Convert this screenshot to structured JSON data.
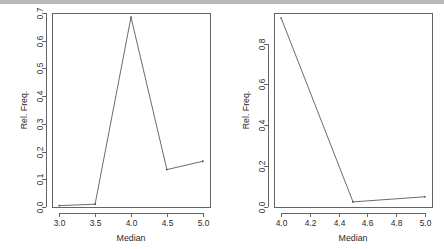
{
  "page": {
    "width": 444,
    "height": 249,
    "background": "#ffffff",
    "top_bar_color": "#b9b9b9",
    "line_color": "#5a5a5a",
    "axis_color": "#646464",
    "text_color": "#2b2b2b"
  },
  "chart_data": [
    {
      "id": "left",
      "type": "line",
      "title": "",
      "xlabel": "Median",
      "ylabel": "Rel. Freq.",
      "x": [
        3.0,
        3.5,
        4.0,
        4.5,
        5.0
      ],
      "values": [
        0.005,
        0.01,
        0.685,
        0.135,
        0.165
      ],
      "xlim": [
        2.9,
        5.1
      ],
      "ylim": [
        0.0,
        0.7
      ],
      "xticks": [
        3.0,
        3.5,
        4.0,
        4.5,
        5.0
      ],
      "xticklabels": [
        "3.0",
        "3.5",
        "4.0",
        "4.5",
        "5.0"
      ],
      "yticks": [
        0.0,
        0.1,
        0.2,
        0.3,
        0.4,
        0.5,
        0.6,
        0.7
      ],
      "yticklabels": [
        "0.0",
        "0.1",
        "0.2",
        "0.3",
        "0.4",
        "0.5",
        "0.6",
        "0.7"
      ],
      "grid": false,
      "legend": false,
      "markers": true
    },
    {
      "id": "right",
      "type": "line",
      "title": "",
      "xlabel": "Median",
      "ylabel": "Rel. Freq.",
      "x": [
        4.0,
        4.5,
        5.0
      ],
      "values": [
        0.925,
        0.025,
        0.05
      ],
      "xlim": [
        3.95,
        5.05
      ],
      "ylim": [
        0.0,
        0.95
      ],
      "xticks": [
        4.0,
        4.2,
        4.4,
        4.6,
        4.8,
        5.0
      ],
      "xticklabels": [
        "4.0",
        "4.2",
        "4.4",
        "4.6",
        "4.8",
        "5.0"
      ],
      "yticks": [
        0.0,
        0.2,
        0.4,
        0.6,
        0.8
      ],
      "yticklabels": [
        "0.0",
        "0.2",
        "0.4",
        "0.6",
        "0.8"
      ],
      "grid": false,
      "legend": false,
      "markers": true
    }
  ]
}
